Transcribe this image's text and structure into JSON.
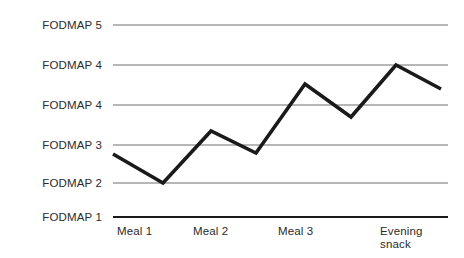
{
  "chart_data": {
    "type": "line",
    "title": "",
    "subtitle": "",
    "xlabel": "",
    "ylabel": "",
    "grid": true,
    "legend": null,
    "y_tick_labels": [
      "FODMAP 5",
      "FODMAP 4",
      "FODMAP 4",
      "FODMAP 3",
      "FODMAP 2",
      "FODMAP 1"
    ],
    "y_tick_pixel_y": [
      25,
      65,
      105,
      145,
      183,
      217
    ],
    "x_tick_labels": [
      "Meal 1",
      "Meal 2",
      "Meal 3",
      "Evening\nsnack"
    ],
    "x_tick_pixel_x": [
      117,
      193,
      278,
      380
    ],
    "plot_left": 113,
    "plot_right": 448,
    "baseline_y": 217,
    "categories": [
      "Meal 1",
      "",
      "Meal 2",
      "",
      "Meal 3",
      "",
      "Evening snack",
      ""
    ],
    "x": [
      113,
      163,
      211,
      256,
      305,
      351,
      396,
      441
    ],
    "values": [
      154,
      183,
      131,
      153,
      84,
      117,
      65,
      89
    ],
    "series": [
      {
        "name": "FODMAP level",
        "points": [
          {
            "x": 113,
            "y": 154
          },
          {
            "x": 163,
            "y": 183
          },
          {
            "x": 211,
            "y": 131
          },
          {
            "x": 256,
            "y": 153
          },
          {
            "x": 305,
            "y": 84
          },
          {
            "x": 351,
            "y": 117
          },
          {
            "x": 396,
            "y": 65
          },
          {
            "x": 441,
            "y": 89
          }
        ]
      }
    ],
    "colors": {
      "line": "#1a1a1a",
      "grid": "#6f6f6f",
      "baseline": "#1a1a1a",
      "text": "#2b2b2b",
      "background": "#ffffff"
    },
    "line_width": 3.6,
    "grid_line_width": 1
  }
}
